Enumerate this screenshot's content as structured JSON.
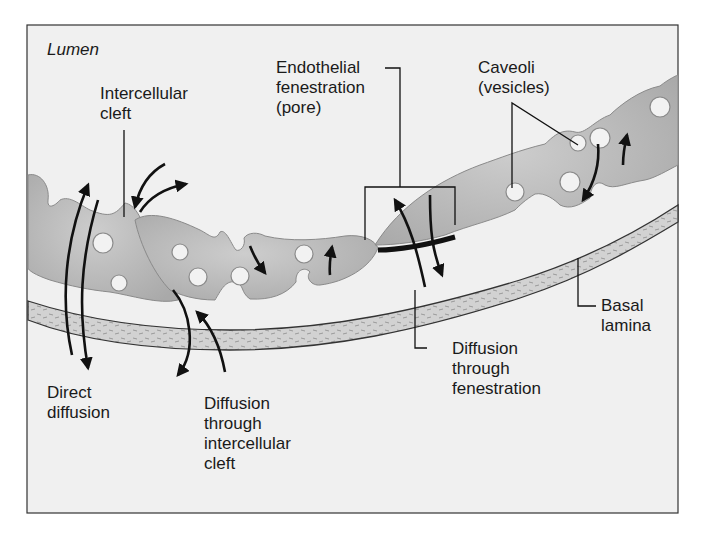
{
  "diagram": {
    "region_label": "Lumen",
    "labels": {
      "intercellular_cleft": "Intercellular\ncleft",
      "endothelial_fenestration": "Endothelial\nfenestration\n(pore)",
      "caveoli": "Caveoli\n(vesicles)",
      "basal_lamina": "Basal\nlamina",
      "direct_diffusion": "Direct\ndiffusion",
      "diffusion_cleft": "Diffusion\nthrough\nintercellular\ncleft",
      "diffusion_fenestration": "Diffusion\nthrough\nfenestration"
    },
    "colors": {
      "background": "#f0f0f0",
      "frame": "#333333",
      "cell_fill": "#b4b4b4",
      "cell_stroke": "#8a8a8a",
      "vesicle_fill": "#f2f2f2",
      "lamina_fill": "#cfcfcf",
      "ink": "#111111"
    }
  }
}
